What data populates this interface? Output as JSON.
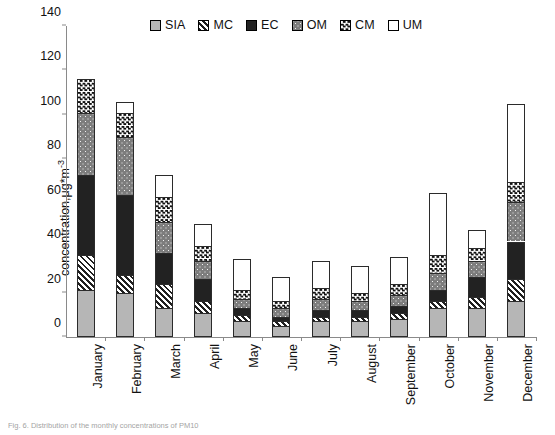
{
  "chart_data": {
    "type": "bar",
    "stacked": true,
    "title": "",
    "xlabel": "",
    "ylabel": "concentration,μg*m-3",
    "ylabel_base": "concentration,μg*m",
    "ylabel_exponent": "-3",
    "ylim": [
      0,
      140
    ],
    "ytick_step": 20,
    "yticks": [
      0,
      20,
      40,
      60,
      80,
      100,
      120,
      140
    ],
    "grid": false,
    "legend_position": "top-center",
    "categories": [
      "January",
      "February",
      "March",
      "April",
      "May",
      "June",
      "July",
      "August",
      "September",
      "October",
      "November",
      "December"
    ],
    "series": [
      {
        "name": "SIA",
        "pattern": "solid-light-gray",
        "color": "#b6b6b6",
        "values": [
          21,
          20,
          13,
          11,
          7,
          5,
          7,
          7,
          8,
          13,
          13,
          16
        ]
      },
      {
        "name": "MC",
        "pattern": "diagonal-hatch",
        "color": "#1f1f1f",
        "values": [
          16,
          8,
          11,
          5,
          3,
          2,
          2,
          2,
          3,
          3,
          5,
          10
        ]
      },
      {
        "name": "EC",
        "pattern": "solid-black",
        "color": "#222222",
        "values": [
          36,
          36,
          14,
          10,
          3,
          2,
          3,
          3,
          3,
          5,
          9,
          17
        ]
      },
      {
        "name": "OM",
        "pattern": "gray-dotted",
        "color": "#7d7d7d",
        "values": [
          28,
          26,
          14,
          8,
          4,
          4,
          5,
          4,
          5,
          8,
          7,
          18
        ]
      },
      {
        "name": "CM",
        "pattern": "checkered",
        "color": "#111111",
        "values": [
          15,
          11,
          11,
          7,
          4,
          3,
          5,
          4,
          5,
          8,
          6,
          9
        ]
      },
      {
        "name": "UM",
        "pattern": "open-white",
        "color": "#ffffff",
        "values": [
          0,
          5,
          10,
          10,
          14,
          11,
          12,
          12,
          12,
          28,
          8,
          35
        ]
      }
    ],
    "totals": [
      116,
      106,
      73,
      51,
      35,
      27,
      34,
      32,
      36,
      65,
      48,
      105
    ],
    "legend": [
      "SIA",
      "MC",
      "EC",
      "OM",
      "CM",
      "UM"
    ]
  },
  "caption": "Fig. 6.  Distribution of the monthly concentrations of PM10"
}
